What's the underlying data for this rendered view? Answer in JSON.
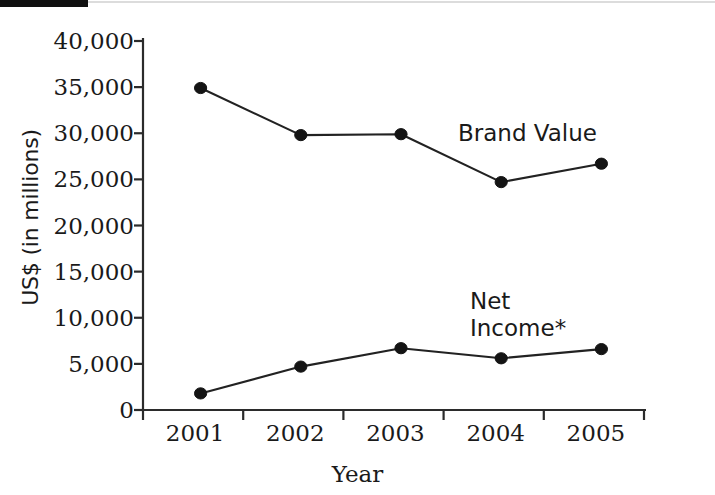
{
  "chart_data": {
    "type": "line",
    "title": "",
    "xlabel": "Year",
    "ylabel": "US$ (in millions)",
    "categories": [
      "2001",
      "2002",
      "2003",
      "2004",
      "2005"
    ],
    "ylim": [
      0,
      40000
    ],
    "yticks": [
      0,
      5000,
      10000,
      15000,
      20000,
      25000,
      30000,
      35000,
      40000
    ],
    "ytick_labels": [
      "0",
      "5,000",
      "10,000",
      "15,000",
      "20,000",
      "25,000",
      "30,000",
      "35,000",
      "40,000"
    ],
    "grid": false,
    "legend_position": "inline-annotation",
    "series": [
      {
        "name": "Brand Value",
        "values": [
          34900,
          29800,
          29900,
          24700,
          26700
        ],
        "marker": "filled-circle",
        "color": "#141414"
      },
      {
        "name": "Net Income*",
        "values": [
          1800,
          4700,
          6700,
          5600,
          6600
        ],
        "marker": "filled-circle",
        "color": "#141414"
      }
    ],
    "annotations": [
      {
        "text": "Brand Value",
        "series": "Brand Value"
      },
      {
        "text": "Net\nIncome*",
        "series": "Net Income*"
      }
    ]
  },
  "axis": {
    "y_title": "US$ (in millions)",
    "x_title": "Year"
  },
  "labels": {
    "brand_value": "Brand Value",
    "net_income": "Net\nIncome*"
  }
}
